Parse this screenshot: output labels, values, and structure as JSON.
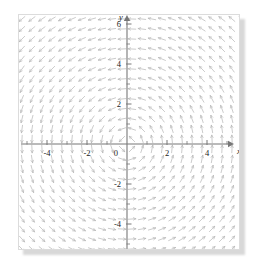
{
  "figure": {
    "kind": "vector-field-plot",
    "background": "#ffffff",
    "frame_border_color": "#dcdcdc",
    "shadow_color": "#d8d8d8"
  },
  "chart_data": {
    "type": "scatter",
    "subtype": "vector-field",
    "title": "",
    "xlabel": "x",
    "ylabel": "y",
    "xlim": [
      -6.8,
      6.8
    ],
    "ylim": [
      -6.8,
      6.8
    ],
    "grid": false,
    "legend": null,
    "axis_color": "#777777",
    "arrow_color": "#b9b9b9",
    "tick_color": "#777777",
    "field": {
      "description": "counterclockwise rotational field, arrows tangent to circles centered at the origin",
      "u_expression": "-y",
      "v_expression": "x",
      "normalized": true,
      "sample_step": 0.5,
      "sample_min": -6.25,
      "sample_max": 6.25,
      "arrow_length_px": 7.5,
      "arrow_head_px": 2.6
    },
    "x_ticks_major": [
      -6,
      -4,
      -2,
      0,
      2,
      4,
      6
    ],
    "x_tick_labels": [
      "-6",
      "-4",
      "-2",
      "0",
      "2",
      "4",
      "6"
    ],
    "y_ticks_major": [
      -6,
      -4,
      -2,
      2,
      4,
      6
    ],
    "y_tick_labels": [
      "-6",
      "-4",
      "-2",
      "2",
      "4",
      "6"
    ],
    "x_ticks_minor": [
      -5,
      -3,
      -1,
      1,
      3,
      5
    ],
    "y_ticks_minor": [
      -5,
      -3,
      -1,
      1,
      3,
      5
    ],
    "origin_label": "0",
    "units_per_tick": 2,
    "pixels_per_unit": 20
  },
  "geometry": {
    "frame_left": 18,
    "frame_top": 14,
    "frame_width": 222,
    "frame_height": 236,
    "origin_x": 108,
    "origin_y": 129,
    "scale": 20
  }
}
